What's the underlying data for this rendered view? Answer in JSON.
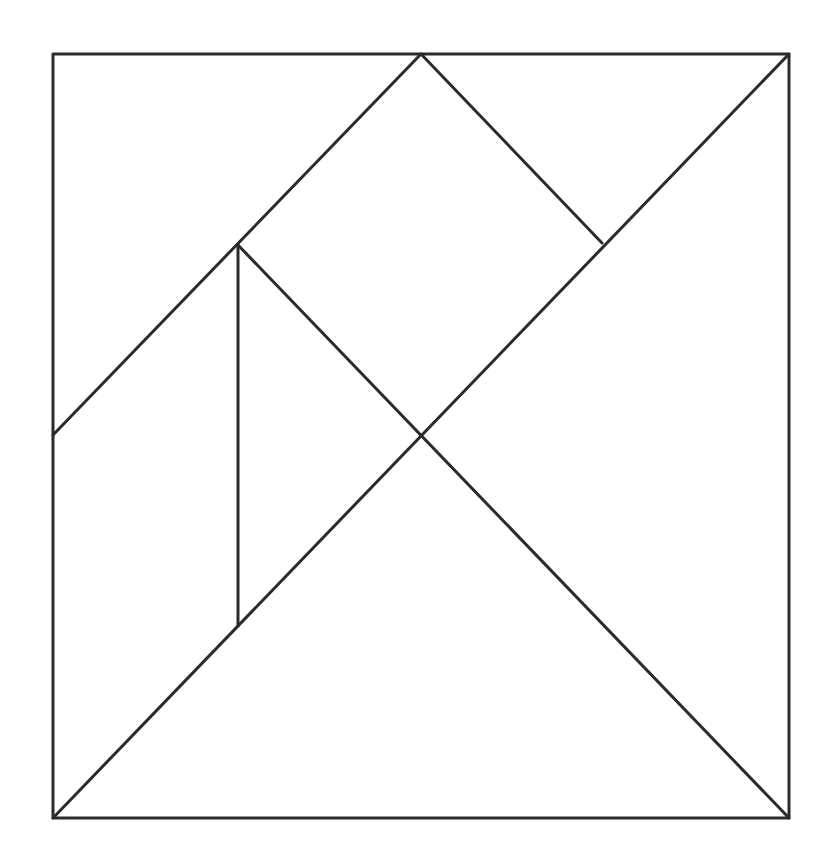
{
  "diagram": {
    "type": "tangram",
    "stroke_color": "#2b2b2b",
    "background": "#ffffff",
    "outer_square": {
      "x1": 53,
      "y1": 54,
      "x2": 789,
      "y2": 818
    },
    "segments": [
      {
        "name": "top-left-diagonal",
        "x1": 53,
        "y1": 435,
        "x2": 421,
        "y2": 54
      },
      {
        "name": "top-right-diagonal-to-square",
        "x1": 421,
        "y1": 54,
        "x2": 602,
        "y2": 243
      },
      {
        "name": "main-diagonal",
        "x1": 53,
        "y1": 818,
        "x2": 789,
        "y2": 54
      },
      {
        "name": "inner-anti-diagonal",
        "x1": 238,
        "y1": 245,
        "x2": 789,
        "y2": 818
      },
      {
        "name": "vertical-parallelogram-edge",
        "x1": 238,
        "y1": 245,
        "x2": 238,
        "y2": 626
      }
    ],
    "pieces": [
      "large-triangle-bottom",
      "large-triangle-right",
      "medium-triangle-top-right",
      "small-triangle-middle",
      "square-top-center",
      "parallelogram-left",
      "triangle-top-left"
    ]
  }
}
